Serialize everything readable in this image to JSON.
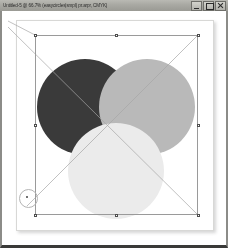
{
  "window": {
    "title": "Untitled-5 @ 66.7% (easycircles|smpl) pr.arpr, CMYK)",
    "controls": {
      "minimize_label": "Minimize",
      "maximize_label": "Maximize",
      "close_label": "Close"
    }
  },
  "document": {
    "name": "Untitled-5",
    "zoom": "66.7%",
    "color_mode": "CMYK",
    "artboard": {
      "x": 14,
      "y": 9,
      "width": 196,
      "height": 209,
      "fill": "#ffffff"
    }
  },
  "selection": {
    "bounds": {
      "x": 33,
      "y": 24,
      "width": 163,
      "height": 180
    },
    "handle_count": 8,
    "stroke": "#9a9a9a",
    "handle_fill": "#ffffff",
    "handle_stroke": "#4d4d4d",
    "cursor_indicator": {
      "x": 25,
      "y": 186,
      "radius": 8.5
    }
  },
  "artwork": {
    "blend_mode": "multiply",
    "shapes": [
      {
        "name": "circle-dark",
        "cx": 83,
        "cy": 96,
        "r": 48,
        "fill": "#3a3a3a",
        "label": "Dark gray circle"
      },
      {
        "name": "circle-medium",
        "cx": 145,
        "cy": 96,
        "r": 48,
        "fill": "#b9b9b9",
        "label": "Medium gray circle"
      },
      {
        "name": "circle-light",
        "cx": 114,
        "cy": 160,
        "r": 48,
        "fill": "#ebebeb",
        "label": "Light gray circle"
      }
    ],
    "guide_lines": [
      {
        "name": "diagonal-tl-br",
        "x1": 6,
        "y1": 16,
        "x2": 196,
        "y2": 204
      },
      {
        "name": "diagonal-tr-bl",
        "x1": 196,
        "y1": 24,
        "x2": 25,
        "y2": 195
      },
      {
        "name": "diagonal-upper-left",
        "x1": 33,
        "y1": 24,
        "x2": 6,
        "y2": 10
      }
    ]
  }
}
